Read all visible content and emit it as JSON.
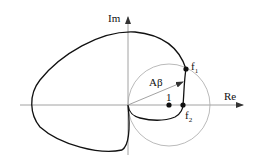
{
  "labels": {
    "im_axis": "Im",
    "re_axis": "Re",
    "vector": "Aβ",
    "unit_point": "1",
    "f1_main": "f",
    "f1_sub": "1",
    "f2_main": "f",
    "f2_sub": "2"
  },
  "colors": {
    "curve": "#111111",
    "axes": "#8a8a8a",
    "circle": "#a8a8a8"
  }
}
